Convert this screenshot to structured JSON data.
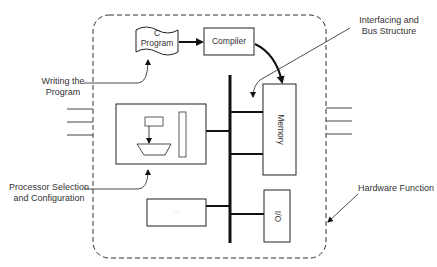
{
  "diagram": {
    "boundary": {
      "label": "Hardware Function"
    },
    "nodes": {
      "c_program": {
        "line1": "C",
        "line2": "Program"
      },
      "compiler": {
        "label": "Compiler"
      },
      "memory": {
        "label": "Memory"
      },
      "io": {
        "label": "I/O"
      },
      "other_block": {
        "label": "..."
      }
    },
    "annotations": {
      "writing_program": {
        "line1": "Writing the",
        "line2": "Program"
      },
      "interfacing": {
        "line1": "Interfacing and",
        "line2": "Bus Structure"
      },
      "processor": {
        "line1": "Processor Selection",
        "line2": "and Configuration"
      },
      "hardware": {
        "label": "Hardware Function"
      }
    }
  }
}
